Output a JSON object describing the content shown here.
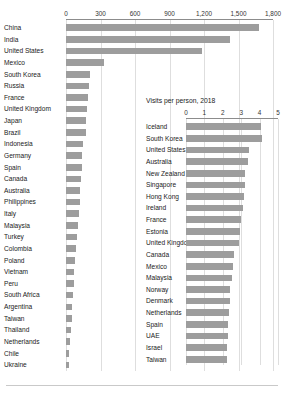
{
  "chart_data": [
    {
      "type": "bar",
      "orientation": "horizontal",
      "id": "total-visits",
      "title": "",
      "xlabel": "",
      "ylabel": "",
      "xlim": [
        0,
        1800
      ],
      "xticks": [
        0,
        300,
        600,
        900,
        1200,
        1500,
        1800
      ],
      "xticklabels": [
        "0",
        "300",
        "600",
        "900",
        "1,200",
        "1,500",
        "1,800"
      ],
      "grid": true,
      "legend": "none",
      "bar_color": "#9d9d9d",
      "categories": [
        "China",
        "India",
        "United States",
        "Mexico",
        "South Korea",
        "Russia",
        "France",
        "United Kingdom",
        "Japan",
        "Brazil",
        "Indonesia",
        "Germany",
        "Spain",
        "Canada",
        "Australia",
        "Philippines",
        "Italy",
        "Malaysia",
        "Turkey",
        "Colombia",
        "Poland",
        "Vietnam",
        "Peru",
        "South Africa",
        "Argentina",
        "Taiwan",
        "Thailand",
        "Netherlands",
        "Chile",
        "Ukraine"
      ],
      "values": [
        1680,
        1430,
        1180,
        330,
        205,
        200,
        195,
        180,
        175,
        170,
        150,
        140,
        135,
        130,
        125,
        120,
        112,
        105,
        95,
        88,
        80,
        72,
        66,
        60,
        54,
        48,
        42,
        36,
        28,
        22
      ]
    },
    {
      "type": "bar",
      "orientation": "horizontal",
      "id": "visits-per-person",
      "title": "Visits per person, 2018",
      "xlabel": "",
      "ylabel": "",
      "xlim": [
        0,
        5
      ],
      "xticks": [
        0,
        1,
        2,
        3,
        4,
        5
      ],
      "xticklabels": [
        "0",
        "1",
        "2",
        "3",
        "4",
        "5"
      ],
      "grid": true,
      "legend": "none",
      "bar_color": "#9d9d9d",
      "categories": [
        "Iceland",
        "South Korea",
        "United States",
        "Australia",
        "New Zealand",
        "Singapore",
        "Hong Kong",
        "Ireland",
        "France",
        "Estonia",
        "United Kingdom",
        "Canada",
        "Mexico",
        "Malaysia",
        "Norway",
        "Denmark",
        "Netherlands",
        "Spain",
        "UAE",
        "Israel",
        "Taiwan"
      ],
      "values": [
        4.1,
        4.15,
        3.45,
        3.35,
        3.2,
        3.2,
        3.15,
        3.1,
        3.0,
        2.95,
        2.9,
        2.6,
        2.55,
        2.5,
        2.4,
        2.4,
        2.35,
        2.3,
        2.3,
        2.25,
        2.25
      ]
    }
  ]
}
